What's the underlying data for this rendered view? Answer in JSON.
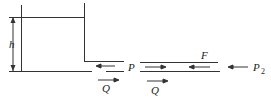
{
  "diagram": {
    "labels": {
      "height": "h",
      "pressure_p": "P",
      "force": "F",
      "pressure_p2_main": "P",
      "pressure_p2_sub": "2",
      "flow_left": "Q",
      "flow_right": "Q"
    },
    "colors": {
      "line": "#333333",
      "background": "#ffffff"
    }
  }
}
